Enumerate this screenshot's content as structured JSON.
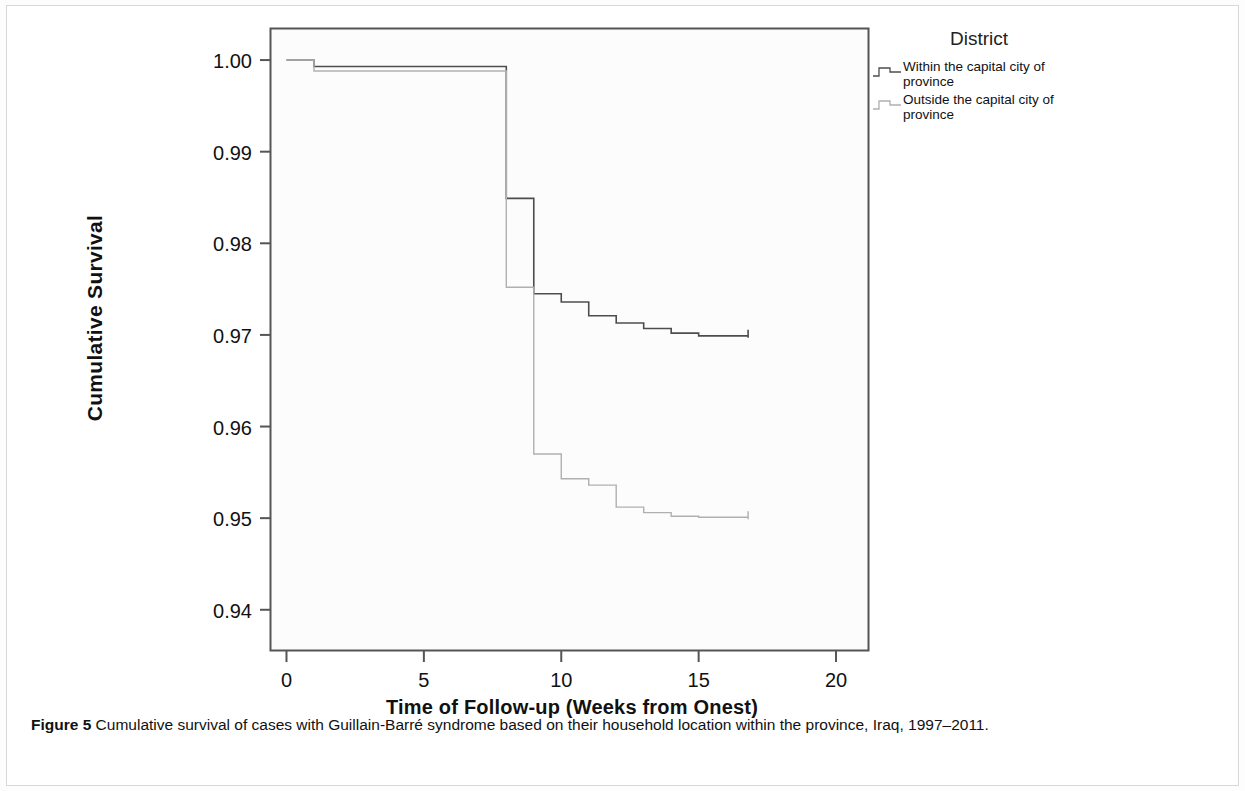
{
  "figure": {
    "caption_label": "Figure 5",
    "caption_text": "Cumulative survival of cases with Guillain-Barré syndrome based on their household location within the province, Iraq, 1997–2011."
  },
  "legend": {
    "title": "District",
    "entries": [
      {
        "label": "Within the capital city of province",
        "color": "#4d4d4d"
      },
      {
        "label": "Outside the capital city of province",
        "color": "#b0b0b0"
      }
    ]
  },
  "chart_data": {
    "type": "line",
    "subtype": "kaplan-meier-step",
    "title": "",
    "xlabel": "Time of Follow-up (Weeks from Onest)",
    "ylabel": "Cumulative Survival",
    "xlim": [
      -0.6,
      21.2
    ],
    "ylim": [
      0.9355,
      1.0035
    ],
    "xticks": [
      0,
      5,
      10,
      15,
      20
    ],
    "xtick_labels": [
      "0",
      "5",
      "10",
      "15",
      "20"
    ],
    "yticks": [
      1.0,
      0.99,
      0.98,
      0.97,
      0.96,
      0.95,
      0.94
    ],
    "ytick_labels": [
      "1.00",
      "0.99",
      "0.98",
      "0.97",
      "0.96",
      "0.95",
      "0.94"
    ],
    "grid": false,
    "legend_position": "right",
    "series": [
      {
        "name": "Within the capital city of province",
        "color": "#4d4d4d",
        "x": [
          0,
          1,
          1,
          8,
          8,
          9,
          9,
          10,
          10,
          11,
          11,
          12,
          12,
          13,
          13,
          14,
          14,
          15,
          15,
          16.8
        ],
        "y": [
          1.0,
          1.0,
          0.9993,
          0.9993,
          0.9849,
          0.9849,
          0.9745,
          0.9745,
          0.9736,
          0.9736,
          0.9721,
          0.9721,
          0.9713,
          0.9713,
          0.9707,
          0.9707,
          0.9702,
          0.9702,
          0.9699,
          0.9699
        ]
      },
      {
        "name": "Outside the capital city of province",
        "color": "#b0b0b0",
        "x": [
          0,
          1,
          1,
          8,
          8,
          9,
          9,
          10,
          10,
          11,
          11,
          12,
          12,
          13,
          13,
          14,
          14,
          15,
          15,
          16.8
        ],
        "y": [
          1.0,
          1.0,
          0.9988,
          0.9988,
          0.9752,
          0.9752,
          0.957,
          0.957,
          0.9543,
          0.9543,
          0.9536,
          0.9536,
          0.9512,
          0.9512,
          0.9506,
          0.9506,
          0.9502,
          0.9502,
          0.9501,
          0.9501
        ]
      }
    ]
  },
  "plot_geometry": {
    "frame_left": 263,
    "frame_top": 22,
    "frame_right": 862,
    "frame_bottom": 645
  }
}
